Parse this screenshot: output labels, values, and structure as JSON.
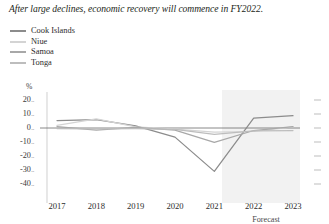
{
  "title": "After large declines, economic recovery will commence in FY2022.",
  "legend": {
    "position": "top-left",
    "items": [
      {
        "label": "Cook Islands",
        "color": "#8c8c8c"
      },
      {
        "label": "Niue",
        "color": "#d4d4d4"
      },
      {
        "label": "Samoa",
        "color": "#a8a8a8"
      },
      {
        "label": "Tonga",
        "color": "#bdbdbd"
      }
    ]
  },
  "axes": {
    "y_unit": "%",
    "y_ticks": [
      "20",
      "10",
      "0",
      "-10",
      "-20",
      "-30",
      "-40"
    ],
    "x_ticks": [
      "2017",
      "2018",
      "2019",
      "2020",
      "2021",
      "2022",
      "2023"
    ],
    "forecast_label": "Forecast"
  },
  "chart_data": {
    "type": "line",
    "title": "After large declines, economic recovery will commence in FY2022.",
    "xlabel": "",
    "ylabel": "%",
    "x": [
      2017,
      2018,
      2019,
      2020,
      2021,
      2022,
      2023
    ],
    "ylim": [
      -40,
      20
    ],
    "xlim": [
      2017,
      2023
    ],
    "grid": false,
    "legend_position": "top-left",
    "annotations": [
      {
        "text": "Forecast",
        "x_from": 2021.5,
        "x_to": 2023,
        "type": "shaded-region"
      }
    ],
    "series": [
      {
        "name": "Cook Islands",
        "color": "#8c8c8c",
        "values": [
          5.3,
          6.0,
          1.5,
          -6.5,
          -31.0,
          7.0,
          8.8
        ]
      },
      {
        "name": "Niue",
        "color": "#d4d4d4",
        "values": [
          1.8,
          6.5,
          0.8,
          -0.8,
          -3.0,
          -2.5,
          0.8
        ]
      },
      {
        "name": "Samoa",
        "color": "#a8a8a8",
        "values": [
          1.0,
          -1.6,
          0.5,
          -1.5,
          -10.2,
          -1.8,
          1.0
        ]
      },
      {
        "name": "Tonga",
        "color": "#bdbdbd",
        "values": [
          -0.4,
          -0.6,
          -0.5,
          -1.0,
          -4.5,
          -2.0,
          -1.8
        ]
      }
    ]
  }
}
